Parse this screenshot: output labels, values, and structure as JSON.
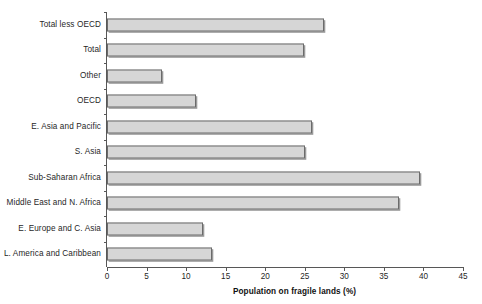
{
  "chart_data": {
    "type": "bar",
    "orientation": "horizontal",
    "title": "",
    "xlabel": "Population on fragile lands (%)",
    "ylabel": "",
    "xlim": [
      0,
      45
    ],
    "xticks": [
      0,
      5,
      10,
      15,
      20,
      25,
      30,
      35,
      40,
      45
    ],
    "grid": false,
    "legend": false,
    "categories": [
      "Total less OECD",
      "Total",
      "Other",
      "OECD",
      "E. Asia and Pacific",
      "S. Asia",
      "Sub-Saharan Africa",
      "Middle East and N. Africa",
      "E. Europe and C. Asia",
      "L. America and Caribbean"
    ],
    "values": [
      27.4,
      24.9,
      6.9,
      11.3,
      25.9,
      25.0,
      39.6,
      36.9,
      12.1,
      13.3
    ],
    "bar_fill_color": "#d6d6d6",
    "bar_border_color": "#6b6b6b",
    "axis_color": "#575757",
    "background_color": "#ffffff"
  }
}
